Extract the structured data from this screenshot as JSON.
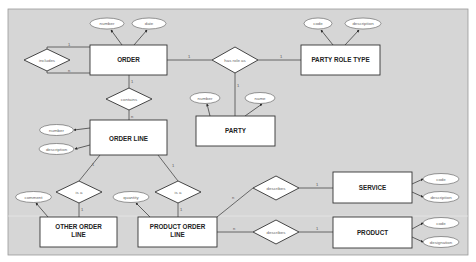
{
  "diagram": {
    "background": "#d9d9d9",
    "stroke": "#3a3a3a",
    "entities": [
      {
        "id": "order",
        "label": "ORDER"
      },
      {
        "id": "party_role_type",
        "label": "PARTY ROLE TYPE"
      },
      {
        "id": "party",
        "label": "PARTY"
      },
      {
        "id": "order_line",
        "label": "ORDER LINE"
      },
      {
        "id": "other_order_line",
        "label_line1": "OTHER ORDER",
        "label_line2": "LINE"
      },
      {
        "id": "product_order_line",
        "label_line1": "PRODUCT ORDER",
        "label_line2": "LINE"
      },
      {
        "id": "service",
        "label": "SERVICE"
      },
      {
        "id": "product",
        "label": "PRODUCT"
      }
    ],
    "relationships": [
      {
        "id": "includes",
        "label": "includes"
      },
      {
        "id": "contains",
        "label": "contains"
      },
      {
        "id": "has_role_as",
        "label": "has role as"
      },
      {
        "id": "is_a_left",
        "label": "is a"
      },
      {
        "id": "is_a_right",
        "label": "is a"
      },
      {
        "id": "describes_service",
        "label": "describes"
      },
      {
        "id": "describes_product",
        "label": "describes"
      }
    ],
    "attributes": [
      {
        "id": "order_number",
        "label": "number"
      },
      {
        "id": "order_date",
        "label": "date"
      },
      {
        "id": "prt_code",
        "label": "code"
      },
      {
        "id": "prt_description",
        "label": "description"
      },
      {
        "id": "party_number",
        "label": "number"
      },
      {
        "id": "party_name",
        "label": "name"
      },
      {
        "id": "ol_number",
        "label": "number"
      },
      {
        "id": "ol_description",
        "label": "description"
      },
      {
        "id": "ool_comment",
        "label": "comment"
      },
      {
        "id": "pol_quantity",
        "label": "quantity"
      },
      {
        "id": "service_code",
        "label": "code"
      },
      {
        "id": "service_description",
        "label": "description"
      },
      {
        "id": "product_code",
        "label": "code"
      },
      {
        "id": "product_designation",
        "label": "designation"
      }
    ],
    "cardinalities": {
      "includes_top": "1",
      "includes_bottom": "n",
      "contains_top": "1",
      "contains_bottom": "n",
      "order_has_role": "1",
      "has_role_prt": "1",
      "has_role_party": "1",
      "ol_isa_left": "1",
      "ol_isa_right": "1",
      "isa_left_ool": "1",
      "isa_right_pol": "1",
      "pol_describes_service": "n",
      "describes_service": "1",
      "pol_describes_product": "n",
      "describes_product": "1"
    }
  }
}
